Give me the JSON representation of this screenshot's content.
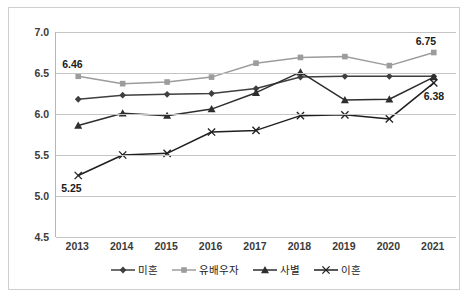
{
  "chart_data": {
    "type": "line",
    "title": "",
    "subtitle": "",
    "xlabel": "",
    "ylabel": "",
    "categories": [
      "2013",
      "2014",
      "2015",
      "2016",
      "2017",
      "2018",
      "2019",
      "2020",
      "2021"
    ],
    "ylim": [
      4.5,
      7.0
    ],
    "ytick_labels": [
      "7.0",
      "6.5",
      "6.0",
      "5.5",
      "5.0",
      "4.5"
    ],
    "ytick_values": [
      7.0,
      6.5,
      6.0,
      5.5,
      5.0,
      4.5
    ],
    "grid": true,
    "legend_position": "bottom",
    "series": [
      {
        "name": "미혼",
        "marker": "diamond",
        "color": "#3f3f3f",
        "values": [
          6.18,
          6.23,
          6.24,
          6.25,
          6.31,
          6.45,
          6.46,
          6.46,
          6.46
        ]
      },
      {
        "name": "유배우자",
        "marker": "square",
        "color": "#9c9c9c",
        "values": [
          6.46,
          6.37,
          6.39,
          6.45,
          6.62,
          6.69,
          6.7,
          6.59,
          6.75
        ]
      },
      {
        "name": "사별",
        "marker": "triangle",
        "color": "#2e2e2e",
        "values": [
          5.86,
          6.01,
          5.98,
          6.06,
          6.26,
          6.51,
          6.17,
          6.18,
          6.45
        ]
      },
      {
        "name": "이혼",
        "marker": "x",
        "color": "#1f1f1f",
        "values": [
          5.25,
          5.5,
          5.52,
          5.78,
          5.8,
          5.98,
          5.99,
          5.94,
          6.38
        ]
      }
    ],
    "point_labels": [
      {
        "text": "6.46",
        "series": "유배우자",
        "category": "2013"
      },
      {
        "text": "5.25",
        "series": "이혼",
        "category": "2013"
      },
      {
        "text": "6.75",
        "series": "유배우자",
        "category": "2021"
      },
      {
        "text": "6.38",
        "series": "이혼",
        "category": "2021"
      }
    ]
  },
  "legend": {
    "items": [
      {
        "label": "미혼"
      },
      {
        "label": "유배우자"
      },
      {
        "label": "사별"
      },
      {
        "label": "이혼"
      }
    ]
  }
}
